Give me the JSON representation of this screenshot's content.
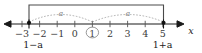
{
  "figure": {
    "axis_label": "x",
    "colors": {
      "axis": "#1a1a1a",
      "tick": "#555555",
      "bracket": "#4a4a4a",
      "arc": "#9a9a9a",
      "endpoint": "#111111",
      "background": "#ffffff"
    }
  },
  "axis": {
    "ticks": [
      {
        "label": "−3",
        "value": -3,
        "x": 22
      },
      {
        "label": "−2",
        "value": -2,
        "x": 39.6
      },
      {
        "label": "−1",
        "value": -1,
        "x": 57.2
      },
      {
        "label": "0",
        "value": 0,
        "x": 74.8
      },
      {
        "label": "1",
        "value": 1,
        "x": 92.4
      },
      {
        "label": "2",
        "value": 2,
        "x": 110
      },
      {
        "label": "3",
        "value": 3,
        "x": 127.6
      },
      {
        "label": "4",
        "value": 4,
        "x": 145.2
      },
      {
        "label": "5",
        "value": 5,
        "x": 162.8
      }
    ],
    "range_min": -3,
    "range_max": 5,
    "left_arrow_x": 6,
    "right_arrow_x": 182,
    "baseline_y": 24
  },
  "interval": {
    "center_label": "1",
    "center_value": 1,
    "center_x": 92.4,
    "left_endpoint": {
      "label": "1−a",
      "x": 29,
      "closed": true
    },
    "right_endpoint": {
      "label": "1+a",
      "x": 163.5,
      "closed": true
    },
    "bracket": {
      "top_y": 5,
      "left_x": 29,
      "right_x": 163.5
    }
  },
  "arcs": [
    {
      "label": "a",
      "from_x": 29,
      "to_x": 92.4,
      "label_x": 61,
      "label_y": 10,
      "peak_y": 14
    },
    {
      "label": "a",
      "from_x": 92.4,
      "to_x": 163.5,
      "label_x": 128,
      "label_y": 10,
      "peak_y": 14
    }
  ]
}
